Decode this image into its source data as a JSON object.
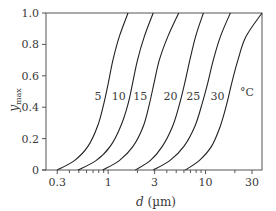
{
  "chart_data": {
    "type": "line",
    "title": "",
    "xlabel": "d (µm)",
    "xlabel_parts": {
      "var": "d",
      "unit": " (µm)"
    },
    "ylabel": "y_max",
    "ylabel_parts": {
      "var": "y",
      "sub": "max"
    },
    "xscale": "log",
    "xlim": [
      0.23,
      38
    ],
    "ylim": [
      0,
      1.0
    ],
    "grid": false,
    "legend": "inline curve labels",
    "x_ticks": [
      {
        "value": 0.3,
        "label": "0.3"
      },
      {
        "value": 1,
        "label": "1"
      },
      {
        "value": 3,
        "label": "3"
      },
      {
        "value": 10,
        "label": "10"
      },
      {
        "value": 30,
        "label": "30"
      }
    ],
    "x_minor_ticks": [
      0.4,
      0.5,
      0.6,
      0.7,
      0.8,
      0.9,
      2,
      4,
      5,
      6,
      7,
      8,
      9,
      20
    ],
    "y_ticks": [
      {
        "value": 0,
        "label": "0"
      },
      {
        "value": 0.2,
        "label": "0.2"
      },
      {
        "value": 0.4,
        "label": "0.4"
      },
      {
        "value": 0.6,
        "label": "0.6"
      },
      {
        "value": 0.8,
        "label": "0.8"
      },
      {
        "value": 1.0,
        "label": "1.0"
      }
    ],
    "unit_label": "°C",
    "series": [
      {
        "name": "5",
        "label": "5",
        "points": [
          [
            0.3,
            0
          ],
          [
            0.45,
            0.06
          ],
          [
            0.62,
            0.15
          ],
          [
            0.78,
            0.28
          ],
          [
            0.9,
            0.42
          ],
          [
            1.0,
            0.55
          ],
          [
            1.12,
            0.7
          ],
          [
            1.3,
            0.85
          ],
          [
            1.6,
            1.0
          ]
        ]
      },
      {
        "name": "10",
        "label": "10",
        "points": [
          [
            0.49,
            0
          ],
          [
            0.75,
            0.06
          ],
          [
            1.05,
            0.15
          ],
          [
            1.35,
            0.28
          ],
          [
            1.6,
            0.42
          ],
          [
            1.78,
            0.55
          ],
          [
            2.0,
            0.7
          ],
          [
            2.35,
            0.85
          ],
          [
            2.9,
            1.0
          ]
        ]
      },
      {
        "name": "15",
        "label": "15",
        "points": [
          [
            0.88,
            0
          ],
          [
            1.3,
            0.06
          ],
          [
            1.8,
            0.15
          ],
          [
            2.3,
            0.28
          ],
          [
            2.65,
            0.42
          ],
          [
            2.95,
            0.55
          ],
          [
            3.35,
            0.7
          ],
          [
            4.1,
            0.85
          ],
          [
            5.3,
            1.0
          ]
        ]
      },
      {
        "name": "20",
        "label": "20",
        "points": [
          [
            1.9,
            0
          ],
          [
            2.7,
            0.06
          ],
          [
            3.6,
            0.15
          ],
          [
            4.6,
            0.28
          ],
          [
            5.4,
            0.42
          ],
          [
            6.1,
            0.55
          ],
          [
            6.9,
            0.7
          ],
          [
            7.9,
            0.85
          ],
          [
            9.5,
            1.0
          ]
        ]
      },
      {
        "name": "25",
        "label": "25",
        "points": [
          [
            2.9,
            0
          ],
          [
            4.3,
            0.06
          ],
          [
            6.0,
            0.15
          ],
          [
            7.8,
            0.28
          ],
          [
            9.2,
            0.42
          ],
          [
            10.5,
            0.55
          ],
          [
            12.0,
            0.7
          ],
          [
            14.2,
            0.85
          ],
          [
            18,
            1.0
          ]
        ]
      },
      {
        "name": "30",
        "label": "30",
        "points": [
          [
            6.2,
            0
          ],
          [
            8.6,
            0.06
          ],
          [
            11.5,
            0.15
          ],
          [
            14.2,
            0.28
          ],
          [
            16.5,
            0.42
          ],
          [
            18.5,
            0.55
          ],
          [
            21.5,
            0.7
          ],
          [
            26,
            0.85
          ],
          [
            38,
            1.0
          ]
        ]
      }
    ],
    "colors": {
      "axis": "#555555",
      "curve": "#222222",
      "text": "#3a3a3a"
    }
  }
}
